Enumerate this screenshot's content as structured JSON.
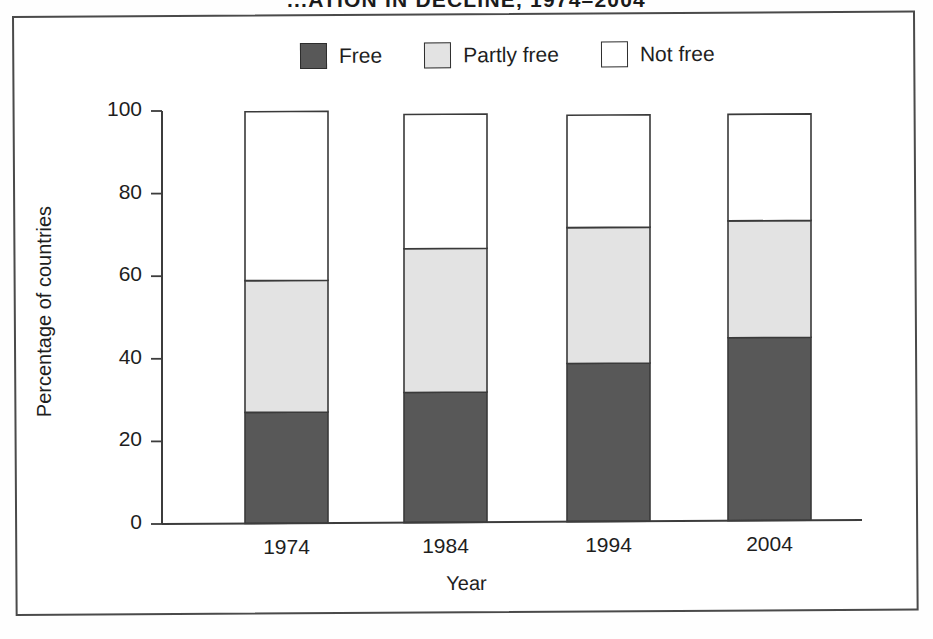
{
  "figure": {
    "title_visible_fragment": "...ATION IN DECLINE, 1974–2004"
  },
  "legend": {
    "position": "top-center",
    "items": [
      {
        "label": "Free",
        "color": "#585858",
        "swatch_name": "legend-swatch-free"
      },
      {
        "label": "Partly free",
        "color": "#e3e3e3",
        "swatch_name": "legend-swatch-partly-free"
      },
      {
        "label": "Not free",
        "color": "#ffffff",
        "swatch_name": "legend-swatch-not-free"
      }
    ]
  },
  "axes": {
    "y_title": "Percentage of countries",
    "x_title": "Year",
    "y_ticks": [
      "0",
      "20",
      "40",
      "60",
      "80",
      "100"
    ],
    "x_ticks": [
      "1974",
      "1984",
      "1994",
      "2004"
    ]
  },
  "chart_data": {
    "type": "bar",
    "stacked": true,
    "xlabel": "Year",
    "ylabel": "Percentage of countries",
    "ylim": [
      0,
      100
    ],
    "yticks": [
      0,
      20,
      40,
      60,
      80,
      100
    ],
    "grid": false,
    "legend_position": "top-center",
    "categories": [
      "1974",
      "1984",
      "1994",
      "2004"
    ],
    "series": [
      {
        "name": "Free",
        "color": "#585858",
        "values": [
          26.9,
          31.5,
          38.3,
          44.3
        ]
      },
      {
        "name": "Partly free",
        "color": "#e3e3e3",
        "values": [
          31.9,
          34.8,
          32.9,
          28.3
        ]
      },
      {
        "name": "Not free",
        "color": "#ffffff",
        "values": [
          40.9,
          32.5,
          27.2,
          25.8
        ]
      }
    ],
    "totals": [
      99.7,
      98.8,
      98.4,
      98.4
    ]
  }
}
